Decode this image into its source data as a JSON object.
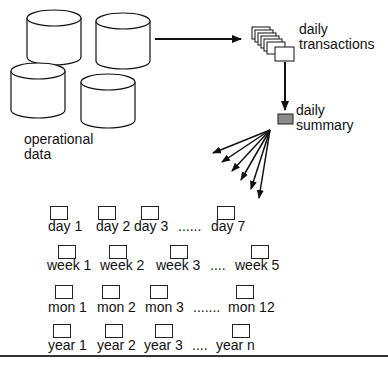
{
  "labels": {
    "operational_data": [
      "operational",
      "data"
    ],
    "daily_transactions": [
      "daily",
      "transactions"
    ],
    "daily_summary": [
      "daily",
      "summary"
    ]
  },
  "grid": {
    "rows": [
      {
        "name": "days",
        "cells": [
          "day 1",
          "day 2",
          "day 3",
          "......",
          "day 7"
        ]
      },
      {
        "name": "weeks",
        "cells": [
          "week 1",
          "week 2",
          "week 3",
          "....",
          "week 5"
        ]
      },
      {
        "name": "months",
        "cells": [
          "mon 1",
          "mon 2",
          "mon 3",
          ".......",
          "mon 12"
        ]
      },
      {
        "name": "years",
        "cells": [
          "year 1",
          "year 2",
          "year 3",
          "....",
          "year n"
        ]
      }
    ]
  },
  "colors": {
    "stroke": "#111111",
    "summary_fill": "#8a8a8a",
    "background": "#ffffff"
  }
}
